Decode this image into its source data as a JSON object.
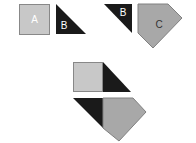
{
  "diagram": {
    "title": "",
    "colors": {
      "square_fill": "#c8c8c8",
      "square_stroke": "#888888",
      "triangle_fill": "#1a1a1a",
      "pentagon_fill": "#a8a8a8",
      "pentagon_stroke": "#808080"
    },
    "pieces": [
      {
        "id": "A",
        "label": "A",
        "shape": "square"
      },
      {
        "id": "B1",
        "label": "B",
        "shape": "right-triangle"
      },
      {
        "id": "B2",
        "label": "B",
        "shape": "right-triangle"
      },
      {
        "id": "C",
        "label": "C",
        "shape": "pentagon"
      }
    ],
    "composites": [
      {
        "id": "top-composite",
        "parts": [
          "square",
          "triangle"
        ]
      },
      {
        "id": "bottom-composite",
        "parts": [
          "triangle",
          "pentagon"
        ]
      }
    ]
  }
}
